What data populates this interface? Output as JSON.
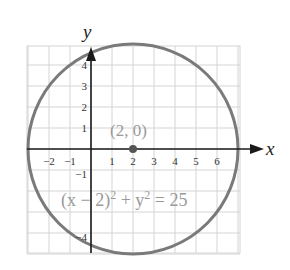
{
  "chart_data": {
    "type": "scatter",
    "title": "",
    "xlabel": "x",
    "ylabel": "y",
    "xlim": [
      -3,
      7
    ],
    "ylim": [
      -5,
      5
    ],
    "grid": true,
    "x_ticks": [
      "−2",
      "−1",
      "1",
      "2",
      "3",
      "4",
      "5",
      "6"
    ],
    "y_ticks": [
      "4",
      "3",
      "2",
      "1",
      "−1",
      "−4"
    ],
    "circle": {
      "center": [
        2,
        0
      ],
      "radius": 5,
      "equation": "(x − 2)² + y² = 25"
    },
    "points": [
      {
        "x": 2,
        "y": 0,
        "label": "(2, 0)"
      }
    ],
    "annotations": [
      {
        "text": "(2, 0)",
        "x": 2,
        "y": 0.8
      },
      {
        "text": "(x − 2)² + y² = 25",
        "x": 2.2,
        "y": -2.6
      }
    ]
  },
  "labels": {
    "x_axis": "x",
    "y_axis": "y",
    "center_point": "(2, 0)",
    "eq_part1": "(x − 2)",
    "eq_sup1": "2",
    "eq_part2": " + y",
    "eq_sup2": "2",
    "eq_part3": " = 25"
  },
  "ticks": {
    "x": [
      {
        "v": -2,
        "label": "−2"
      },
      {
        "v": -1,
        "label": "−1"
      },
      {
        "v": 1,
        "label": "1"
      },
      {
        "v": 2,
        "label": "2"
      },
      {
        "v": 3,
        "label": "3"
      },
      {
        "v": 4,
        "label": "4"
      },
      {
        "v": 5,
        "label": "5"
      },
      {
        "v": 6,
        "label": "6"
      }
    ],
    "y": [
      {
        "v": 4,
        "label": "4"
      },
      {
        "v": 3,
        "label": "3"
      },
      {
        "v": 2,
        "label": "2"
      },
      {
        "v": 1,
        "label": "1"
      },
      {
        "v": -1,
        "label": "−1"
      },
      {
        "v": -4,
        "label": "−4"
      }
    ]
  },
  "colors": {
    "grid": "#d4d4d4",
    "axis": "#1a1a1a",
    "circle": "#7a7a7a",
    "point": "#555555",
    "annotation": "#9a9a9a"
  }
}
